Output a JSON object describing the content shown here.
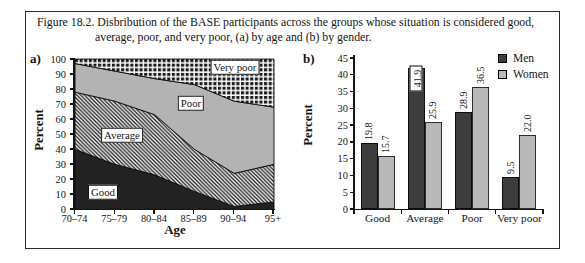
{
  "figure_caption": {
    "line1": "Figure 18.2. Disbribution of the BASE participants across the groups whose situation is considered good,",
    "line2": "average, poor, and very poor, (a) by age and (b) by gender."
  },
  "chart_data": [
    {
      "panel_label": "a)",
      "type": "area",
      "stacked": true,
      "title": "",
      "xlabel": "Age",
      "ylabel": "Percent",
      "x_categories": [
        "70–74",
        "75–79",
        "80–84",
        "85–89",
        "90–94",
        "95+"
      ],
      "ylim": [
        0,
        100
      ],
      "y_ticks": [
        0,
        10,
        20,
        30,
        40,
        50,
        60,
        70,
        80,
        90,
        100
      ],
      "grid": false,
      "series": [
        {
          "name": "Good",
          "style": "solid-dark",
          "values": [
            40,
            30,
            23,
            12,
            2,
            5
          ]
        },
        {
          "name": "Average",
          "style": "diagonal-hatch",
          "values": [
            38,
            42,
            40,
            28,
            22,
            25
          ]
        },
        {
          "name": "Poor",
          "style": "solid-gray",
          "values": [
            19,
            20,
            24,
            43,
            48,
            38
          ]
        },
        {
          "name": "Very poor",
          "style": "checker",
          "values": [
            3,
            8,
            13,
            17,
            28,
            32
          ]
        }
      ],
      "area_labels": [
        "Good",
        "Average",
        "Poor",
        "Very poor"
      ]
    },
    {
      "panel_label": "b)",
      "type": "bar",
      "grouped": true,
      "title": "",
      "xlabel": "",
      "ylabel": "Percent",
      "x_categories": [
        "Good",
        "Average",
        "Poor",
        "Very poor"
      ],
      "ylim": [
        0,
        45
      ],
      "y_ticks": [
        0,
        5,
        10,
        15,
        20,
        25,
        30,
        35,
        40,
        45
      ],
      "grid": false,
      "series": [
        {
          "name": "Men",
          "color": "#3c3c3c",
          "values": [
            19.8,
            41.9,
            28.9,
            9.5
          ],
          "labels": [
            "19.8",
            "41.9",
            "28.9",
            "9.5"
          ]
        },
        {
          "name": "Women",
          "color": "#b9b9b9",
          "values": [
            15.7,
            25.9,
            36.5,
            22.0
          ],
          "labels": [
            "15.7",
            "25.9",
            "36.5",
            "22.0"
          ]
        }
      ],
      "boxed_value_label": "41.9",
      "legend": {
        "position": "top-right",
        "entries": [
          "Men",
          "Women"
        ]
      }
    }
  ],
  "colors": {
    "ink": "#141414",
    "area_good": "#222222",
    "area_poor": "#b3b3b3",
    "bar_men": "#3c3c3c",
    "bar_women": "#b9b9b9",
    "background": "#ffffff"
  }
}
